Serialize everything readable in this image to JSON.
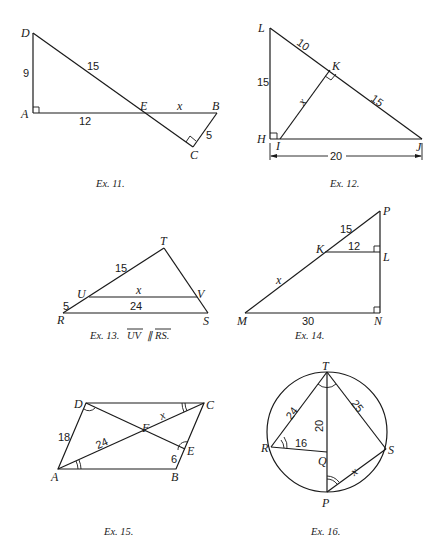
{
  "figures": {
    "ex11": {
      "caption": "Ex. 11.",
      "points": {
        "D": "D",
        "A": "A",
        "E": "E",
        "B": "B",
        "C": "C"
      },
      "labels": {
        "DA": "9",
        "DE": "15",
        "AE": "12",
        "EB": "x",
        "BC": "5"
      }
    },
    "ex12": {
      "caption": "Ex. 12.",
      "points": {
        "L": "L",
        "K": "K",
        "H": "H",
        "I": "I",
        "J": "J"
      },
      "labels": {
        "LH": "15",
        "LK": "10",
        "KJ": "15",
        "IK": "x",
        "HJ": "20"
      }
    },
    "ex13": {
      "caption": "Ex. 13.",
      "caption_math": "UV ∥ RS.",
      "caption_seg1": "UV",
      "caption_par": "∥",
      "caption_seg2": "RS.",
      "points": {
        "T": "T",
        "U": "U",
        "V": "V",
        "R": "R",
        "S": "S"
      },
      "labels": {
        "TU": "15",
        "UR": "5",
        "UV": "x",
        "RS": "24"
      }
    },
    "ex14": {
      "caption": "Ex. 14.",
      "points": {
        "P": "P",
        "K": "K",
        "L": "L",
        "M": "M",
        "N": "N"
      },
      "labels": {
        "PK": "15",
        "KL": "12",
        "MK": "x",
        "MN": "30"
      }
    },
    "ex15": {
      "caption": "Ex. 15.",
      "points": {
        "D": "D",
        "C": "C",
        "F": "F",
        "E": "E",
        "A": "A",
        "B": "B"
      },
      "labels": {
        "AD": "18",
        "AF": "24",
        "FC": "x",
        "EB": "6"
      }
    },
    "ex16": {
      "caption": "Ex. 16.",
      "points": {
        "T": "T",
        "R": "R",
        "S": "S",
        "Q": "Q",
        "P": "P"
      },
      "labels": {
        "RT": "24",
        "TS": "25",
        "TQ": "20",
        "RQ": "16",
        "PS": "x"
      }
    }
  }
}
